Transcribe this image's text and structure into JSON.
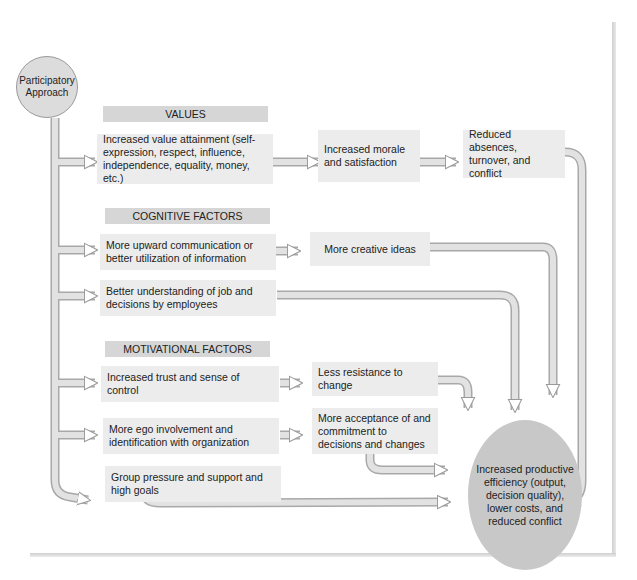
{
  "start_node": {
    "label": "Participatory Approach"
  },
  "sections": [
    {
      "header": "VALUES",
      "rows": [
        {
          "cause": "Increased value attainment (self-expression, respect, influence, independence, equality, money, etc.)",
          "effect": "Increased morale and satisfaction",
          "effect2": "Reduced absences, turnover, and conflict"
        }
      ]
    },
    {
      "header": "COGNITIVE FACTORS",
      "rows": [
        {
          "cause": "More upward communication or better utilization of information",
          "effect": "More creative ideas"
        },
        {
          "cause": "Better understanding of job and decisions by employees"
        }
      ]
    },
    {
      "header": "MOTIVATIONAL FACTORS",
      "rows": [
        {
          "cause": "Increased trust and sense of control",
          "effect": "Less resistance to change"
        },
        {
          "cause": "More ego involvement and identification with organization",
          "effect": "More acceptance of and commitment to decisions and changes"
        },
        {
          "cause": "Group pressure and support and high goals"
        }
      ]
    }
  ],
  "end_node": {
    "label": "Increased productive efficiency (output, decision quality), lower costs, and reduced conflict"
  },
  "colors": {
    "box": "#ececec",
    "header": "#d6d6d6",
    "end_circle": "#c8c8c8",
    "start_circle": "#dcdcdc",
    "arrow": "#d4d4d4",
    "arrow_outline": "#9a9a9a"
  }
}
